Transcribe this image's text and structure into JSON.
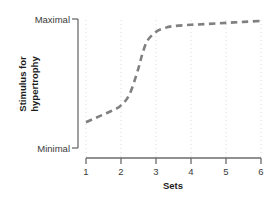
{
  "chart_data": {
    "type": "line",
    "title": "",
    "xlabel": "Sets",
    "ylabel_line1": "Stimulus for",
    "ylabel_line2": "hypertrophy",
    "x": [
      1,
      1.25,
      1.5,
      1.75,
      2,
      2.25,
      2.5,
      2.6,
      2.75,
      3,
      3.25,
      3.5,
      4,
      4.5,
      5,
      5.5,
      6
    ],
    "y": [
      0.2,
      0.23,
      0.26,
      0.29,
      0.33,
      0.42,
      0.62,
      0.72,
      0.83,
      0.9,
      0.93,
      0.945,
      0.955,
      0.962,
      0.97,
      0.978,
      0.985
    ],
    "xticks": [
      "1",
      "2",
      "3",
      "4",
      "5",
      "6"
    ],
    "xlim": [
      1,
      6
    ],
    "ylim": [
      0,
      1
    ],
    "yticks": [
      "Minimal",
      "Maximal"
    ],
    "ytick_values": [
      0,
      1
    ],
    "ymin_label": "Minimal",
    "ymax_label": "Maximal",
    "grid": "vertical-dotted-at-each-xtick",
    "legend": "none",
    "line_style": "dashed",
    "line_color": "#808080",
    "grid_color": "#dcdcdc",
    "axis_color": "#6b6b6b",
    "text_color": "#3a3a3a"
  },
  "xticks": [
    {
      "label": "1",
      "px": 86
    },
    {
      "label": "2",
      "px": 121
    },
    {
      "label": "3",
      "px": 156
    },
    {
      "label": "4",
      "px": 191
    },
    {
      "label": "5",
      "px": 226
    },
    {
      "label": "6",
      "px": 261
    }
  ]
}
